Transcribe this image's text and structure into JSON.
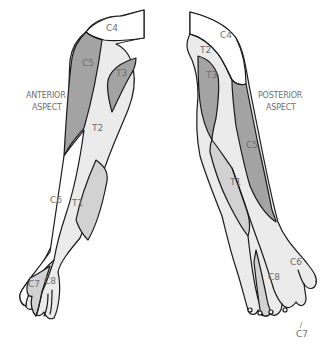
{
  "figure": {
    "type": "dermatome-map",
    "colors": {
      "dark": "#a3a3a3",
      "mid": "#d2d2d2",
      "light": "#ebebeb",
      "white": "#ffffff",
      "outline": "#1a1a1a",
      "label": "#6f6f6f"
    },
    "anterior": {
      "aspect_line1": "ANTERIOR",
      "aspect_line2": "ASPECT",
      "labels": {
        "c4": "C4",
        "c5": "C5",
        "t3": "T3",
        "t2": "T2",
        "c6": "C6",
        "t1": "T1",
        "c7": "C7",
        "c8": "C8"
      }
    },
    "posterior": {
      "aspect_line1": "POSTERIOR",
      "aspect_line2": "ASPECT",
      "labels": {
        "c4": "C4",
        "t2": "T2",
        "t3": "T3",
        "c5": "C5",
        "t1": "T1",
        "c6": "C6",
        "c8": "C8",
        "c7": "C7"
      }
    }
  }
}
